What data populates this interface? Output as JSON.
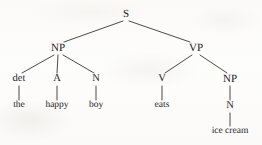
{
  "figure": {
    "kind": "syntax-tree",
    "sentence": "the happy boy eats ice cream",
    "ink_color": "#26231f",
    "line_color": "#3a3632",
    "background_color": "#fdfcfb"
  },
  "nodes": [
    {
      "id": "s",
      "label": "S",
      "x": 126,
      "y": 14,
      "level": "root"
    },
    {
      "id": "np1",
      "label": "NP",
      "x": 58,
      "y": 48,
      "level": "phrase"
    },
    {
      "id": "vp",
      "label": "VP",
      "x": 196,
      "y": 48,
      "level": "phrase"
    },
    {
      "id": "det",
      "label": "det",
      "x": 19,
      "y": 79,
      "level": "pos"
    },
    {
      "id": "a",
      "label": "A",
      "x": 57,
      "y": 79,
      "level": "pos"
    },
    {
      "id": "n1",
      "label": "N",
      "x": 96,
      "y": 79,
      "level": "pos"
    },
    {
      "id": "v",
      "label": "V",
      "x": 162,
      "y": 79,
      "level": "pos"
    },
    {
      "id": "np2",
      "label": "NP",
      "x": 230,
      "y": 79,
      "level": "phrase"
    },
    {
      "id": "the",
      "label": "the",
      "x": 19,
      "y": 106,
      "level": "word"
    },
    {
      "id": "happy",
      "label": "happy",
      "x": 57,
      "y": 106,
      "level": "word"
    },
    {
      "id": "boy",
      "label": "boy",
      "x": 96,
      "y": 106,
      "level": "word"
    },
    {
      "id": "eats",
      "label": "eats",
      "x": 162,
      "y": 106,
      "level": "word"
    },
    {
      "id": "n2",
      "label": "N",
      "x": 230,
      "y": 106,
      "level": "pos"
    },
    {
      "id": "icecream",
      "label": "ice cream",
      "x": 230,
      "y": 132,
      "level": "word"
    }
  ],
  "edges": [
    {
      "from": "s",
      "to": "np1",
      "x1": 123,
      "y1": 21,
      "x2": 64,
      "y2": 42
    },
    {
      "from": "s",
      "to": "vp",
      "x1": 129,
      "y1": 21,
      "x2": 190,
      "y2": 42
    },
    {
      "from": "np1",
      "to": "det",
      "x1": 54,
      "y1": 55,
      "x2": 22,
      "y2": 73
    },
    {
      "from": "np1",
      "to": "a",
      "x1": 58,
      "y1": 55,
      "x2": 57,
      "y2": 73
    },
    {
      "from": "np1",
      "to": "n1",
      "x1": 63,
      "y1": 55,
      "x2": 94,
      "y2": 73
    },
    {
      "from": "vp",
      "to": "v",
      "x1": 192,
      "y1": 55,
      "x2": 165,
      "y2": 73
    },
    {
      "from": "vp",
      "to": "np2",
      "x1": 200,
      "y1": 55,
      "x2": 227,
      "y2": 73
    },
    {
      "from": "det",
      "to": "the",
      "x1": 19,
      "y1": 86,
      "x2": 19,
      "y2": 100
    },
    {
      "from": "a",
      "to": "happy",
      "x1": 57,
      "y1": 86,
      "x2": 57,
      "y2": 100
    },
    {
      "from": "n1",
      "to": "boy",
      "x1": 96,
      "y1": 86,
      "x2": 96,
      "y2": 100
    },
    {
      "from": "v",
      "to": "eats",
      "x1": 162,
      "y1": 86,
      "x2": 162,
      "y2": 100
    },
    {
      "from": "np2",
      "to": "n2",
      "x1": 230,
      "y1": 86,
      "x2": 230,
      "y2": 100
    },
    {
      "from": "n2",
      "to": "icecream",
      "x1": 230,
      "y1": 113,
      "x2": 230,
      "y2": 126
    }
  ]
}
